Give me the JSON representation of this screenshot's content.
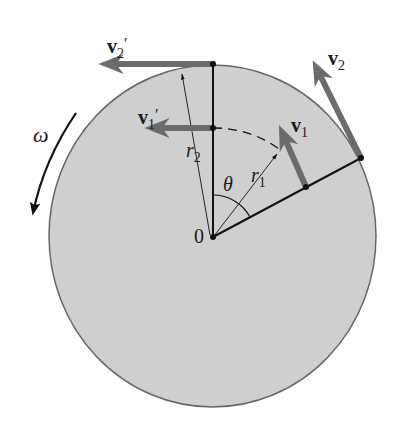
{
  "diagram": {
    "colors": {
      "disk_fill": "#cfcfcf",
      "disk_stroke": "#666666",
      "vector": "#6b6b6b",
      "line": "#111111",
      "background": "#ffffff"
    },
    "labels": {
      "v2_prime": {
        "base": "v",
        "sub": "2",
        "prime": "′"
      },
      "v1_prime": {
        "base": "v",
        "sub": "1",
        "prime": "′"
      },
      "v2": {
        "base": "v",
        "sub": "2"
      },
      "v1": {
        "base": "v",
        "sub": "1"
      },
      "r2": {
        "base": "r",
        "sub": "2"
      },
      "r1": {
        "base": "r",
        "sub": "1"
      },
      "theta": "θ",
      "omega": "ω",
      "origin": "0"
    }
  }
}
